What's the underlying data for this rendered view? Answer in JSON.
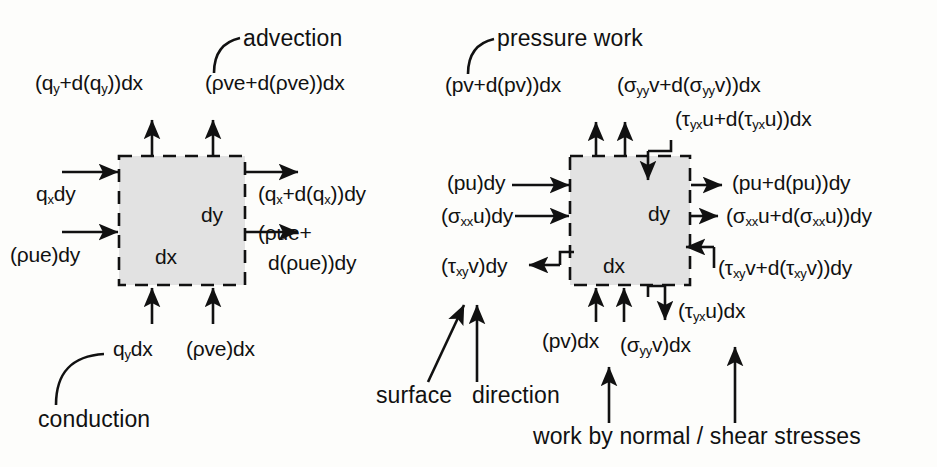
{
  "figure": {
    "type": "diagram",
    "background_color": "#fdfdfb",
    "control_volume_fill": "#e2e2e2",
    "line_color": "#111111"
  },
  "left_panel": {
    "name": "conduction-and-advection-fluxes",
    "callouts": {
      "advection": "advection",
      "conduction": "conduction"
    },
    "control_volume": {
      "width_label": "dx",
      "height_label": "dy"
    },
    "top_labels": [
      {
        "id": "q-y-out",
        "text": "(q_y+d(q_y))dx"
      },
      {
        "id": "rho-ve-out",
        "text": "(ρve+d(ρve))dx"
      }
    ],
    "left_labels": [
      {
        "id": "q-x-in",
        "text": "q_xdy"
      },
      {
        "id": "rho-ue-in",
        "text": "(ρue)dy"
      }
    ],
    "right_labels": [
      {
        "id": "q-x-out",
        "text": "(q_x+d(q_x))dy"
      },
      {
        "id": "rho-ue-out1",
        "text": "(ρue+"
      },
      {
        "id": "rho-ue-out2",
        "text": "d(ρue))dy"
      }
    ],
    "bottom_labels": [
      {
        "id": "q-y-in",
        "text": "q_ydx"
      },
      {
        "id": "rho-ve-in",
        "text": "(ρve)dx"
      }
    ]
  },
  "right_panel": {
    "name": "pressure-and-stress-work-fluxes",
    "callouts": {
      "pressure_work": "pressure work",
      "surface": "surface",
      "direction": "direction",
      "stresses": "work by normal / shear stresses"
    },
    "control_volume": {
      "width_label": "dx",
      "height_label": "dy"
    },
    "top_labels": [
      {
        "id": "pv-out",
        "text": "(pv+d(pv))dx"
      },
      {
        "id": "sigma-yy-out",
        "text": "(σ_yyv+d(σ_yyv))dx"
      },
      {
        "id": "tau-yx-out",
        "text": "(τ_yxu+d(τ_yxu))dx"
      }
    ],
    "left_labels": [
      {
        "id": "pu-in",
        "text": "(pu)dy"
      },
      {
        "id": "sigma-xx-in",
        "text": "(σ_xxu)dy"
      },
      {
        "id": "tau-xy-in",
        "text": "(τ_xyv)dy"
      }
    ],
    "right_labels": [
      {
        "id": "pu-out",
        "text": "(pu+d(pu))dy"
      },
      {
        "id": "sigma-xx-out",
        "text": "(σ_xxu+d(σ_xxu))dy"
      },
      {
        "id": "tau-xy-out",
        "text": "(τ_xyv+d(τ_xyv))dy"
      }
    ],
    "bottom_labels": [
      {
        "id": "pv-in",
        "text": "(pv)dx"
      },
      {
        "id": "sigma-yy-in",
        "text": "(σ_yyv)dx"
      },
      {
        "id": "tau-yx-in",
        "text": "(τ_yxu)dx"
      }
    ]
  }
}
